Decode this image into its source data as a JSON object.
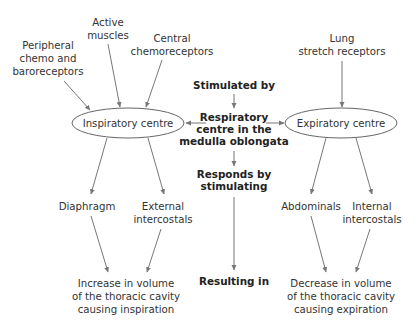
{
  "diagram": {
    "inputs_inspiratory": {
      "peripheral": [
        "Peripheral",
        "chemo and",
        "baroreceptors"
      ],
      "active_muscles": [
        "Active",
        "muscles"
      ],
      "central": [
        "Central",
        "chemoreceptors"
      ]
    },
    "inputs_expiratory": {
      "lung_stretch": [
        "Lung",
        "stretch receptors"
      ]
    },
    "nodes": {
      "inspiratory_centre": "Inspiratory centre",
      "expiratory_centre": "Expiratory centre"
    },
    "center_column": {
      "stimulated_by": "Stimulated by",
      "respiratory_centre": [
        "Respiratory",
        "centre in the",
        "medulla oblongata"
      ],
      "responds_by": [
        "Responds by",
        "stimulating"
      ],
      "resulting_in": "Resulting in"
    },
    "muscles_inspiration": {
      "diaphragm": "Diaphragm",
      "external_intercostals": [
        "External",
        "intercostals"
      ]
    },
    "muscles_expiration": {
      "abdominals": "Abdominals",
      "internal_intercostals": [
        "Internal",
        "intercostals"
      ]
    },
    "outcomes": {
      "inspiration": [
        "Increase in volume",
        "of the thoracic cavity",
        "causing inspiration"
      ],
      "expiration": [
        "Decrease in volume",
        "of the thoracic cavity",
        "causing expiration"
      ]
    }
  }
}
